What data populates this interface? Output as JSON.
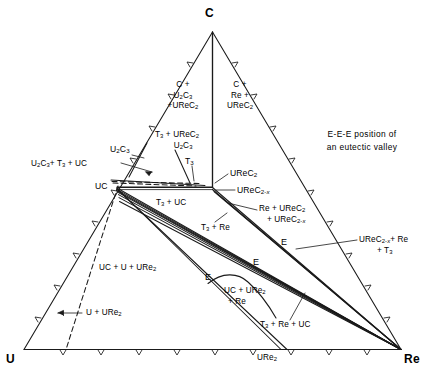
{
  "figure": {
    "type": "ternary-phase-diagram",
    "system": "U-Re-C",
    "vertices": [
      {
        "id": "C",
        "label": "C",
        "position": "top"
      },
      {
        "id": "U",
        "label": "U",
        "position": "bottom-left"
      },
      {
        "id": "Re",
        "label": "Re",
        "position": "bottom-right"
      }
    ],
    "annotation": {
      "line1": "E-E-E position of",
      "line2": "an eutectic valley"
    },
    "edge_labels": [
      {
        "name": "URe2-binary-label",
        "text_html": "URe<sub>2</sub>",
        "edge": "bottom"
      }
    ],
    "phase_nodes": [
      {
        "name": "UC",
        "text_html": "UC"
      },
      {
        "name": "U2C3",
        "text_html": "U<sub>2</sub>C<sub>3</sub>"
      },
      {
        "name": "UReC2",
        "text_html": "UReC<sub>2</sub>"
      },
      {
        "name": "UReC2-x",
        "text_html": "UReC<sub>2-<span class=\"ital\">x</span></sub>"
      },
      {
        "name": "T3",
        "text_html": "T<sub>3</sub>"
      }
    ],
    "eutectic_markers": [
      {
        "name": "eutectic-E-1",
        "label": "E"
      },
      {
        "name": "eutectic-E-2",
        "label": "E"
      },
      {
        "name": "eutectic-E-3",
        "label": "E"
      }
    ],
    "region_labels": [
      {
        "name": "region-C-U2C3-UReC2",
        "lines": [
          "C +",
          "U<sub>2</sub>C<sub>3</sub>",
          "+UReC<sub>2</sub>"
        ]
      },
      {
        "name": "region-C-Re-UReC2",
        "lines": [
          "C +",
          "Re +",
          "UReC<sub>2</sub>"
        ]
      },
      {
        "name": "region-T3-UReC2-U2C3",
        "lines": [
          "T<sub>3</sub> + UReC<sub>2</sub>",
          "U<sub>2</sub>C<sub>3</sub>"
        ]
      },
      {
        "name": "region-U2C3-T3-UC",
        "lines": [
          "U<sub>2</sub>C<sub>3</sub>+ T<sub>3</sub> + UC"
        ]
      },
      {
        "name": "region-T3-UC",
        "lines": [
          "T<sub>3</sub> + UC"
        ]
      },
      {
        "name": "region-Re-UReC2-UReC2x",
        "lines": [
          "Re + UReC<sub>2</sub>",
          "+ UReC<sub>2-<span class=\"ital\">x</span></sub>"
        ]
      },
      {
        "name": "region-T3-Re",
        "lines": [
          "T<sub>3</sub> + Re"
        ]
      },
      {
        "name": "region-UReC2x-Re-T3",
        "lines": [
          "UReC<sub>2-<span class=\"ital\">x</span></sub>+ Re",
          "+ T<sub>3</sub>"
        ]
      },
      {
        "name": "region-UC-U-URe2",
        "lines": [
          "UC + U + URe<sub>2</sub>"
        ]
      },
      {
        "name": "region-U-URe2",
        "lines": [
          "U + URe<sub>2</sub>"
        ]
      },
      {
        "name": "region-UC-URe2-Re",
        "lines": [
          "UC + URe<sub>2</sub>",
          "+ Re"
        ]
      },
      {
        "name": "region-T3-Re-UC",
        "lines": [
          "T<sub>3</sub> + Re + UC"
        ]
      }
    ],
    "style": {
      "line_color": "#1a1a1a",
      "background": "#ffffff",
      "text_color": "#000000"
    }
  },
  "chart_data": {
    "type": "scatter",
    "xlabel": "",
    "ylabel": "",
    "legend": [
      "E-E-E position of an eutectic valley"
    ],
    "categories": [
      "C",
      "U",
      "Re"
    ],
    "values": [
      100,
      0,
      0
    ],
    "annotations": [
      "C + U2C3 + UReC2",
      "C + Re + UReC2",
      "T3 + UReC2 U2C3",
      "U2C3 + T3 + UC",
      "T3 + UC",
      "Re + UReC2 + UReC2-x",
      "T3 + Re",
      "UReC2-x + Re + T3",
      "UC + U + URe2",
      "U + URe2",
      "UC + URe2 + Re",
      "T3 + Re + UC"
    ]
  }
}
